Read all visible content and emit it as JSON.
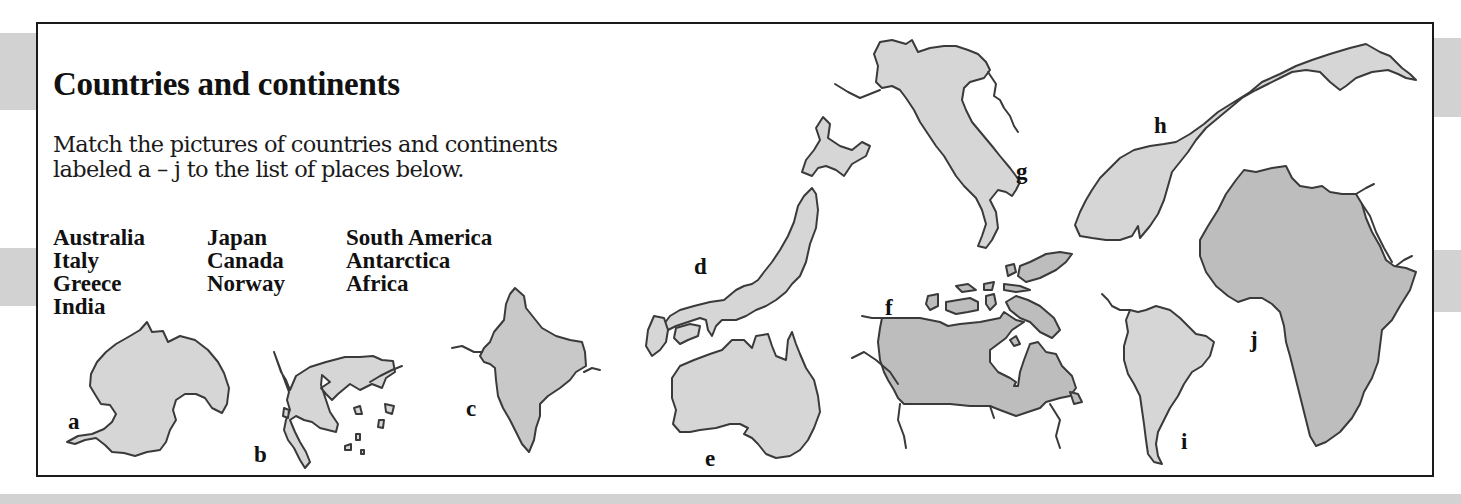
{
  "page": {
    "title": "Countries and continents",
    "instructions_line1": "Match the pictures of countries and continents",
    "instructions_line2": "labeled a – j to the list of places below."
  },
  "places": {
    "column1": [
      "Australia",
      "Italy",
      "Greece",
      "India"
    ],
    "column2": [
      "Japan",
      "Canada",
      "Norway"
    ],
    "column3": [
      "South America",
      "Antarctica",
      "Africa"
    ]
  },
  "map_labels": {
    "a": "a",
    "b": "b",
    "c": "c",
    "d": "d",
    "e": "e",
    "f": "f",
    "g": "g",
    "h": "h",
    "i": "i",
    "j": "j"
  },
  "colors": {
    "land_fill_light": "#d6d6d6",
    "land_fill_dark": "#bdbdbd",
    "outline": "#3a3a3a",
    "side_band": "#d2d2d2"
  }
}
